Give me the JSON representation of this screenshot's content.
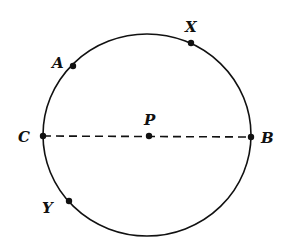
{
  "diagram": {
    "type": "geometry-circle",
    "center_label": "P",
    "circle": {
      "cx": 147,
      "cy": 135,
      "rx": 104,
      "ry": 101,
      "stroke": "#111111"
    },
    "diameter": {
      "from": "C",
      "to": "B",
      "style": "dashed"
    },
    "points": [
      {
        "id": "A",
        "label": "A",
        "x": 73,
        "y": 66,
        "lx": 52,
        "ly": 68
      },
      {
        "id": "X",
        "label": "X",
        "x": 191,
        "y": 43,
        "lx": 185,
        "ly": 32
      },
      {
        "id": "C",
        "label": "C",
        "x": 43,
        "y": 136,
        "lx": 18,
        "ly": 142
      },
      {
        "id": "B",
        "label": "B",
        "x": 251,
        "y": 137,
        "lx": 261,
        "ly": 143
      },
      {
        "id": "P",
        "label": "P",
        "x": 149,
        "y": 136,
        "lx": 144,
        "ly": 125
      },
      {
        "id": "Y",
        "label": "Y",
        "x": 69,
        "y": 201,
        "lx": 42,
        "ly": 213
      }
    ]
  }
}
